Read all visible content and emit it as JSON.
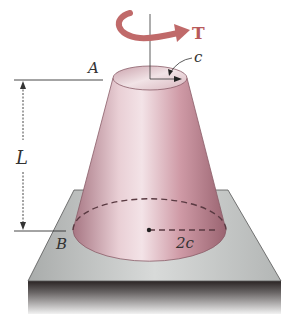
{
  "figure": {
    "labels": {
      "torque": "T",
      "top_radius": "c",
      "bottom_radius": "2c",
      "length": "L",
      "point_top": "A",
      "point_bottom": "B"
    },
    "colors": {
      "cone_body": "#d6a9b2",
      "cone_shadow": "#a4707c",
      "torque_arrow": "#c06a6a",
      "plate_top": "#c9cbca",
      "plate_side_dark": "#2a2424",
      "dim_lines": "#333333"
    }
  }
}
